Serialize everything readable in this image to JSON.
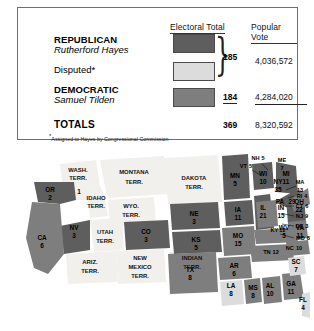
{
  "table": {
    "headers": {
      "electoral": "Electoral Total",
      "popular": "Popular Vote"
    },
    "rows": [
      {
        "party": "REPUBLICAN",
        "candidate": "Rutherford Hayes",
        "swatch": "dark-gray",
        "electoral": "185",
        "popular": "4,036,572"
      },
      {
        "party": "Disputed*",
        "candidate": "",
        "swatch": "light-gray",
        "electoral": "",
        "popular": ""
      },
      {
        "party": "DEMOCRATIC",
        "candidate": "Samuel Tilden",
        "swatch": "medium-gray",
        "electoral": "184",
        "popular": "4,284,020"
      }
    ],
    "totals": {
      "label": "TOTALS",
      "electoral": "369",
      "popular": "8,320,592"
    },
    "footnote_marker": "*",
    "footnote": "Assigned to Hayes by Congressional Commission"
  },
  "colors": {
    "republican": "#5e5e5e",
    "disputed": "#dcdcdc",
    "democratic": "#7e7e7e",
    "territory": "#f2f0ec",
    "water": "#ffffff",
    "border": "#6e6e6e"
  },
  "map": {
    "title": "Election of 1876 electoral map",
    "legend_note": "Shading matches Electoral Total swatches",
    "states": [
      {
        "name": "OR",
        "votes": "2",
        "party": "republican"
      },
      {
        "name": "CA",
        "votes": "6",
        "party": "democratic"
      },
      {
        "name": "NV",
        "votes": "3",
        "party": "republican"
      },
      {
        "name": "NE",
        "votes": "3",
        "party": "republican"
      },
      {
        "name": "KS",
        "votes": "5",
        "party": "republican"
      },
      {
        "name": "CO",
        "votes": "3",
        "party": "republican"
      },
      {
        "name": "TX",
        "votes": "8",
        "party": "democratic"
      },
      {
        "name": "MN",
        "votes": "5",
        "party": "republican"
      },
      {
        "name": "IA",
        "votes": "11",
        "party": "republican"
      },
      {
        "name": "MO",
        "votes": "15",
        "party": "democratic"
      },
      {
        "name": "AR",
        "votes": "6",
        "party": "democratic"
      },
      {
        "name": "LA",
        "votes": "8",
        "party": "disputed"
      },
      {
        "name": "MS",
        "votes": "8",
        "party": "democratic"
      },
      {
        "name": "WI",
        "votes": "10",
        "party": "republican"
      },
      {
        "name": "IL",
        "votes": "21",
        "party": "republican"
      },
      {
        "name": "MI",
        "votes": "11",
        "party": "republican"
      },
      {
        "name": "IN",
        "votes": "15",
        "party": "democratic"
      },
      {
        "name": "OH",
        "votes": "22",
        "party": "republican"
      },
      {
        "name": "KY",
        "votes": "12",
        "party": "democratic"
      },
      {
        "name": "TN",
        "votes": "12",
        "party": "democratic"
      },
      {
        "name": "AL",
        "votes": "10",
        "party": "democratic"
      },
      {
        "name": "GA",
        "votes": "11",
        "party": "democratic"
      },
      {
        "name": "FL",
        "votes": "4",
        "party": "disputed"
      },
      {
        "name": "SC",
        "votes": "7",
        "party": "disputed"
      },
      {
        "name": "NC",
        "votes": "10",
        "party": "democratic"
      },
      {
        "name": "WV",
        "votes": "5",
        "party": "democratic"
      },
      {
        "name": "VA",
        "votes": "11",
        "party": "democratic"
      },
      {
        "name": "MD",
        "votes": "8",
        "party": "democratic"
      },
      {
        "name": "DE",
        "votes": "3",
        "party": "democratic"
      },
      {
        "name": "NJ",
        "votes": "9",
        "party": "democratic"
      },
      {
        "name": "PA",
        "votes": "29",
        "party": "republican"
      },
      {
        "name": "NY",
        "votes": "35",
        "party": "democratic"
      },
      {
        "name": "CT",
        "votes": "6",
        "party": "democratic"
      },
      {
        "name": "RI",
        "votes": "4",
        "party": "republican"
      },
      {
        "name": "MA",
        "votes": "13",
        "party": "republican"
      },
      {
        "name": "VT",
        "votes": "5",
        "party": "republican"
      },
      {
        "name": "NH",
        "votes": "5",
        "party": "republican"
      },
      {
        "name": "ME",
        "votes": "7",
        "party": "republican"
      }
    ],
    "territories": [
      {
        "label_line1": "WASH.",
        "label_line2": "TERR."
      },
      {
        "label_line1": "IDAHO",
        "label_line2": "TERR."
      },
      {
        "label_line1": "MONTANA",
        "label_line2": "TERR."
      },
      {
        "label_line1": "WYO.",
        "label_line2": "TERR."
      },
      {
        "label_line1": "DAKOTA",
        "label_line2": "TERR."
      },
      {
        "label_line1": "UTAH",
        "label_line2": "TERR."
      },
      {
        "label_line1": "ARIZ.",
        "label_line2": "TERR."
      },
      {
        "label_line1": "NEW",
        "label_line2": "MEXICO",
        "label_line3": "TERR."
      },
      {
        "label_line1": "INDIAN",
        "label_line2": "TERR."
      },
      {
        "label_line1": "1",
        "label_line2": ""
      }
    ]
  }
}
